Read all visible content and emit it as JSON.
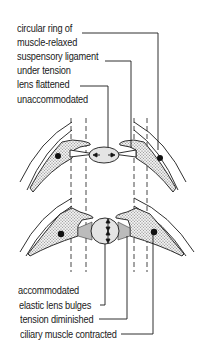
{
  "diagram": {
    "top_state": {
      "labels": [
        "circular ring of",
        "muscle-relaxed",
        "suspensory ligament",
        "under tension",
        "lens flattened",
        "unaccommodated"
      ]
    },
    "bottom_state": {
      "labels": [
        "accommodated",
        "elastic lens bulges",
        "tension diminished",
        "ciliary muscle contracted"
      ]
    },
    "colors": {
      "line": "#1a1a1a",
      "muscle_fill": "#d9d9d9",
      "lens_fill": "#e4e4e4",
      "background": "#ffffff"
    }
  }
}
